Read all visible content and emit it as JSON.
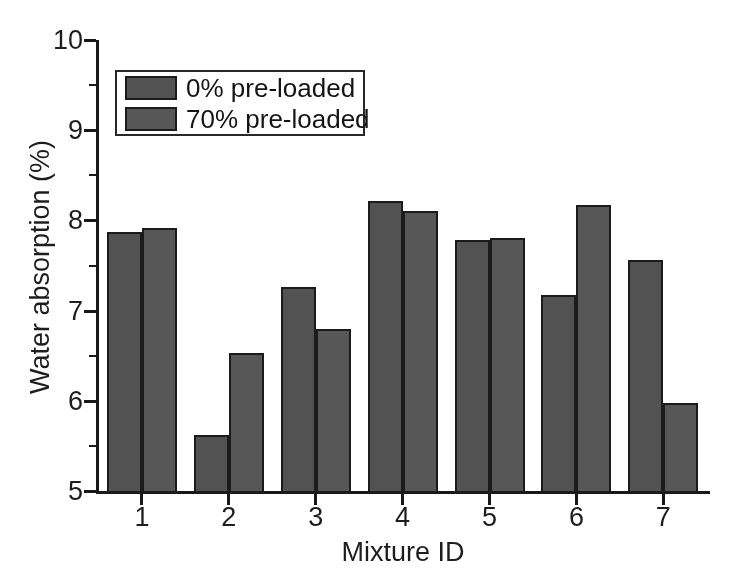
{
  "chart_data": {
    "type": "bar",
    "title": "",
    "categories": [
      "1",
      "2",
      "3",
      "4",
      "5",
      "6",
      "7"
    ],
    "series": [
      {
        "name": "0% pre-loaded",
        "values": [
          7.87,
          5.62,
          7.26,
          8.22,
          7.78,
          7.17,
          7.56
        ]
      },
      {
        "name": "70% pre-loaded",
        "values": [
          7.92,
          6.53,
          6.8,
          8.1,
          7.8,
          8.17,
          5.98
        ]
      }
    ],
    "xlabel": "Mixture ID",
    "ylabel": "Water absorption (%)",
    "ylim": [
      5,
      10
    ],
    "yticks": [
      5,
      6,
      7,
      8,
      9,
      10
    ],
    "yminorticks": [
      5.5,
      6.5,
      7.5,
      8.5,
      9.5
    ],
    "grid": false,
    "legend_position": "upper-left",
    "colors": {
      "bar_series_0": "#535353",
      "bar_series_1": "#585858",
      "axis": "#1b1b1b",
      "text": "#1f1f1f",
      "background": "#ffffff"
    }
  }
}
